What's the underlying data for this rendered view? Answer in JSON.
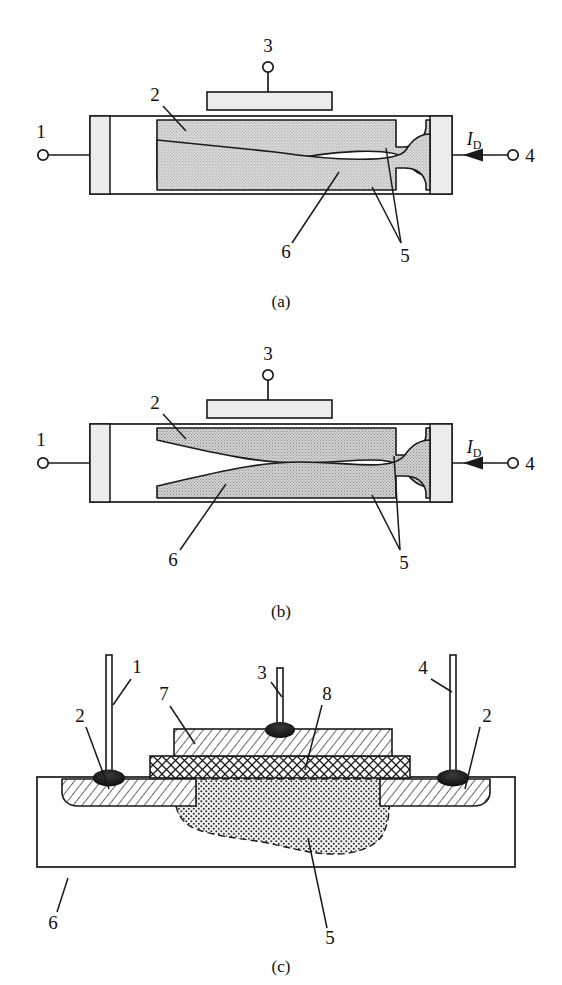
{
  "figure": {
    "type": "semiconductor-device-cross-section-diagram",
    "panels": [
      {
        "id": "a",
        "caption": "(a)",
        "state": "below pinch-off",
        "labels": [
          {
            "key": "t1",
            "text": "1",
            "role": "source-terminal"
          },
          {
            "key": "t3",
            "text": "3",
            "role": "gate-terminal"
          },
          {
            "key": "t4",
            "text": "4",
            "role": "drain-terminal"
          },
          {
            "key": "n2",
            "text": "2",
            "role": "gate-region-callout"
          },
          {
            "key": "n5",
            "text": "5",
            "role": "depletion-region-callout"
          },
          {
            "key": "n6",
            "text": "6",
            "role": "channel-substrate-callout"
          },
          {
            "key": "current",
            "text": "I",
            "sub": "D",
            "role": "drain-current"
          }
        ]
      },
      {
        "id": "b",
        "caption": "(b)",
        "state": "at pinch-off",
        "labels": [
          {
            "key": "t1",
            "text": "1",
            "role": "source-terminal"
          },
          {
            "key": "t3",
            "text": "3",
            "role": "gate-terminal"
          },
          {
            "key": "t4",
            "text": "4",
            "role": "drain-terminal"
          },
          {
            "key": "n2",
            "text": "2",
            "role": "gate-region-callout"
          },
          {
            "key": "n5",
            "text": "5",
            "role": "depletion-region-callout"
          },
          {
            "key": "n6",
            "text": "6",
            "role": "channel-substrate-callout"
          },
          {
            "key": "current",
            "text": "I",
            "sub": "D",
            "role": "drain-current"
          }
        ]
      },
      {
        "id": "c",
        "caption": "(c)",
        "state": "planar construction",
        "labels": [
          {
            "key": "t1",
            "text": "1",
            "role": "source-lead"
          },
          {
            "key": "t3",
            "text": "3",
            "role": "gate-lead"
          },
          {
            "key": "t4",
            "text": "4",
            "role": "drain-lead"
          },
          {
            "key": "n2l",
            "text": "2",
            "role": "left-diffusion-callout"
          },
          {
            "key": "n2r",
            "text": "2",
            "role": "right-diffusion-callout"
          },
          {
            "key": "n5",
            "text": "5",
            "role": "channel-region-callout"
          },
          {
            "key": "n6",
            "text": "6",
            "role": "substrate-callout"
          },
          {
            "key": "n7",
            "text": "7",
            "role": "metal-gate-layer-callout"
          },
          {
            "key": "n8",
            "text": "8",
            "role": "oxide-layer-callout"
          }
        ]
      }
    ],
    "colors": {
      "line": "#1a1a1a",
      "shade_light": "#e4e4e4",
      "shade_depletion": "#d2d2d2",
      "contact_fill": "#ececec",
      "solder": "#111111",
      "background": "#ffffff"
    }
  }
}
